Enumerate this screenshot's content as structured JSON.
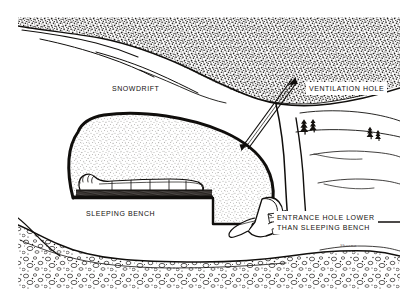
{
  "figure": {
    "medium": "pen-and-ink stipple illustration",
    "signature": "Sheena"
  },
  "labels": {
    "snowdrift": "SNOWDRIFT",
    "ventilation_hole": "VENTILATION HOLE",
    "sleeping_bench": "SLEEPING BENCH",
    "entrance_line1": "ENTRANCE HOLE LOWER",
    "entrance_line2": "THAN SLEEPING BENCH"
  },
  "colors": {
    "ink": "#14110f",
    "paper": "#ffffff",
    "stipple_dense": "#2b2724",
    "stipple_light": "#6e6862",
    "outline": "#100e0c"
  },
  "scene": {
    "regions": [
      {
        "name": "snowdrift-mass",
        "fill": "dense-stipple",
        "position": "upper band across full width"
      },
      {
        "name": "cave-interior",
        "fill": "light-stipple",
        "position": "center-left dome"
      },
      {
        "name": "sleeping-bench-platform",
        "fill": "dark-hatch",
        "position": "floor of cave"
      },
      {
        "name": "ground-rock-layer",
        "fill": "pebble-texture",
        "position": "bottom band"
      },
      {
        "name": "distant-snowfield",
        "fill": "white",
        "position": "right side"
      }
    ],
    "figures": [
      {
        "name": "sleeping-person",
        "description": "person in sleeping bag on bench"
      },
      {
        "name": "entering-person",
        "description": "person crawling through entrance hole"
      }
    ],
    "trees": 3,
    "wind_lines": 6
  }
}
